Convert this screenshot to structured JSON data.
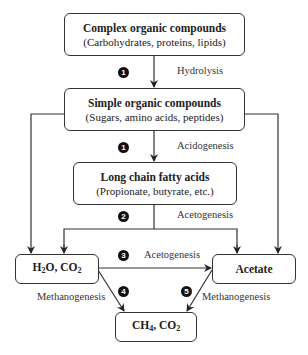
{
  "diagram": {
    "nodes": [
      {
        "id": "complex",
        "title": "Complex organic compounds",
        "subtitle": "(Carbohydrates, proteins, lipids)"
      },
      {
        "id": "simple",
        "title": "Simple organic compounds",
        "subtitle": "(Sugars, amino acids, peptides)"
      },
      {
        "id": "lcfa",
        "title": "Long chain fatty acids",
        "subtitle": "(Propionate, butyrate, etc.)"
      },
      {
        "id": "h2o_co2",
        "title_main": "H",
        "title_sub1": "2",
        "title_mid": "O, CO",
        "title_sub2": "2"
      },
      {
        "id": "acetate",
        "title": "Acetate"
      },
      {
        "id": "ch4_co2",
        "title_main": "CH",
        "title_sub1": "4",
        "title_mid": ", CO",
        "title_sub2": "2"
      }
    ],
    "steps": [
      {
        "number": "1",
        "label": "Hydrolysis"
      },
      {
        "number": "1",
        "label": "Acidogenesis"
      },
      {
        "number": "2",
        "label": "Acetogenesis"
      },
      {
        "number": "3",
        "label": "Acetogenesis"
      },
      {
        "number": "4",
        "label": "Methanogenesis"
      },
      {
        "number": "5",
        "label": "Methanogenesis"
      }
    ],
    "edges": [
      {
        "from": "complex",
        "to": "simple",
        "step": "1 Hydrolysis"
      },
      {
        "from": "simple",
        "to": "lcfa",
        "step": "1 Acidogenesis"
      },
      {
        "from": "simple",
        "to": "h2o_co2"
      },
      {
        "from": "simple",
        "to": "acetate"
      },
      {
        "from": "lcfa",
        "to": "h2o_co2",
        "step": "2 Acetogenesis"
      },
      {
        "from": "lcfa",
        "to": "acetate",
        "step": "2 Acetogenesis"
      },
      {
        "from": "h2o_co2",
        "to": "acetate",
        "step": "3 Acetogenesis"
      },
      {
        "from": "h2o_co2",
        "to": "ch4_co2",
        "step": "4 Methanogenesis"
      },
      {
        "from": "acetate",
        "to": "ch4_co2",
        "step": "5 Methanogenesis"
      }
    ]
  }
}
